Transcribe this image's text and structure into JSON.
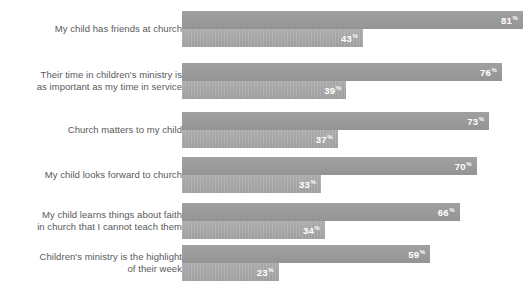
{
  "chart_data": {
    "type": "bar",
    "orientation": "horizontal",
    "title": "",
    "subtitle": "",
    "xlabel": "",
    "ylabel": "",
    "xlim": [
      0,
      100
    ],
    "grid": false,
    "legend_position": "none",
    "value_suffix": "%",
    "categories": [
      "My child has friends at church",
      "Their time in children's ministry is\nas important as my time in service",
      "Church matters to my child",
      "My child looks forward to church",
      "My child learns things about faith\nin church that I cannot teach them",
      "Children's ministry is the highlight\nof their week"
    ],
    "series": [
      {
        "name": "upper-bar",
        "color": "#9a9a9a",
        "values": [
          81,
          76,
          73,
          70,
          66,
          59
        ]
      },
      {
        "name": "lower-bar",
        "color": "#a6a6a6",
        "values": [
          43,
          39,
          37,
          33,
          34,
          23
        ]
      }
    ],
    "rows": [
      {
        "label": "My child has friends at church",
        "label_align": "right",
        "upper_value": 81,
        "upper_value_text": "81",
        "lower_value": 43,
        "lower_value_text": "43"
      },
      {
        "label": "Their time in children's ministry is\nas important as my time in service",
        "label_align": "right",
        "upper_value": 76,
        "upper_value_text": "76",
        "lower_value": 39,
        "lower_value_text": "39"
      },
      {
        "label": "Church matters to my child",
        "label_align": "right",
        "upper_value": 73,
        "upper_value_text": "73",
        "lower_value": 37,
        "lower_value_text": "37"
      },
      {
        "label": "My child looks forward to church",
        "label_align": "right",
        "upper_value": 70,
        "upper_value_text": "70",
        "lower_value": 33,
        "lower_value_text": "33"
      },
      {
        "label": "My child learns things about faith\nin church that I cannot teach them",
        "label_align": "right",
        "upper_value": 66,
        "upper_value_text": "66",
        "lower_value": 34,
        "lower_value_text": "34"
      },
      {
        "label": "Children's ministry is the highlight\nof their week",
        "label_align": "right",
        "upper_value": 59,
        "upper_value_text": "59",
        "lower_value": 23,
        "lower_value_text": "23"
      }
    ]
  },
  "layout": {
    "bar_origin_x": 182,
    "px_per_percent": 4.21,
    "bar_height": 18,
    "group_top_offsets": [
      11,
      63,
      112,
      157,
      203,
      245
    ],
    "colors": {
      "upper_bar": "#9a9a9a",
      "lower_bar": "#a6a6a6",
      "label_text": "#58595b",
      "value_text": "#ffffff",
      "background": "#ffffff"
    }
  }
}
